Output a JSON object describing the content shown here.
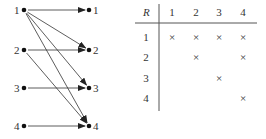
{
  "graph": {
    "left_nodes": [
      {
        "label": "1",
        "x": 24,
        "y": 10
      },
      {
        "label": "2",
        "x": 24,
        "y": 50
      },
      {
        "label": "3",
        "x": 24,
        "y": 88
      },
      {
        "label": "4",
        "x": 24,
        "y": 126
      }
    ],
    "right_nodes": [
      {
        "label": "1",
        "x": 89,
        "y": 10
      },
      {
        "label": "2",
        "x": 89,
        "y": 50
      },
      {
        "label": "3",
        "x": 89,
        "y": 88
      },
      {
        "label": "4",
        "x": 89,
        "y": 126
      }
    ],
    "edges": [
      [
        1,
        1
      ],
      [
        1,
        2
      ],
      [
        1,
        3
      ],
      [
        1,
        4
      ],
      [
        2,
        2
      ],
      [
        2,
        4
      ],
      [
        3,
        3
      ],
      [
        4,
        4
      ]
    ]
  },
  "table": {
    "corner": "R",
    "columns": [
      "1",
      "2",
      "3",
      "4"
    ],
    "rows": [
      {
        "label": "1",
        "cells": [
          "×",
          "×",
          "×",
          "×"
        ]
      },
      {
        "label": "2",
        "cells": [
          "",
          "×",
          "",
          "×"
        ]
      },
      {
        "label": "3",
        "cells": [
          "",
          "",
          "×",
          ""
        ]
      },
      {
        "label": "4",
        "cells": [
          "",
          "",
          "",
          "×"
        ]
      }
    ]
  }
}
